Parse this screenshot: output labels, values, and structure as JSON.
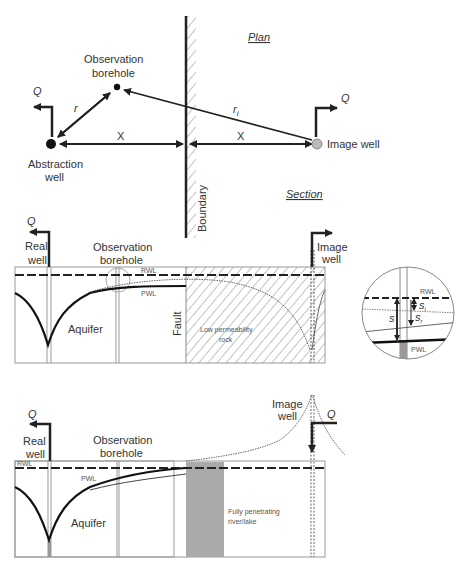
{
  "plan": {
    "title": "Plan",
    "observation_label_1": "Observation",
    "observation_label_2": "borehole",
    "abstraction_label_1": "Abstraction",
    "abstraction_label_2": "well",
    "image_well_label": "Image well",
    "q_left": "Q",
    "q_right": "Q",
    "r_label": "r",
    "ri_label": "r",
    "ri_sub": "i",
    "x_left": "X",
    "x_right": "X",
    "boundary_label": "Boundary"
  },
  "section_top": {
    "title": "Section",
    "q_label": "Q",
    "real_well_1": "Real",
    "real_well_2": "well",
    "observation_1": "Observation",
    "observation_2": "borehole",
    "rwl": "RWL",
    "pwl": "PWL",
    "aquifer": "Aquifer",
    "fault": "Fault",
    "low_perm_1": "Low permeability",
    "low_perm_2": "rock",
    "image_well_1": "Image",
    "image_well_2": "well"
  },
  "inset": {
    "rwl": "RWL",
    "pwl": "PWL",
    "s": "s",
    "si": "s",
    "si_sub": "i",
    "sr": "s",
    "sr_sub": "r"
  },
  "section_bottom": {
    "q_left": "Q",
    "q_right": "Q",
    "real_well_1": "Real",
    "real_well_2": "well",
    "observation_1": "Observation",
    "observation_2": "borehole",
    "rwl": "RWL",
    "pwl": "PWL",
    "aquifer": "Aquifer",
    "river_1": "Fully penetrating",
    "river_2": "river/lake",
    "image_well_1": "Image",
    "image_well_2": "well"
  }
}
